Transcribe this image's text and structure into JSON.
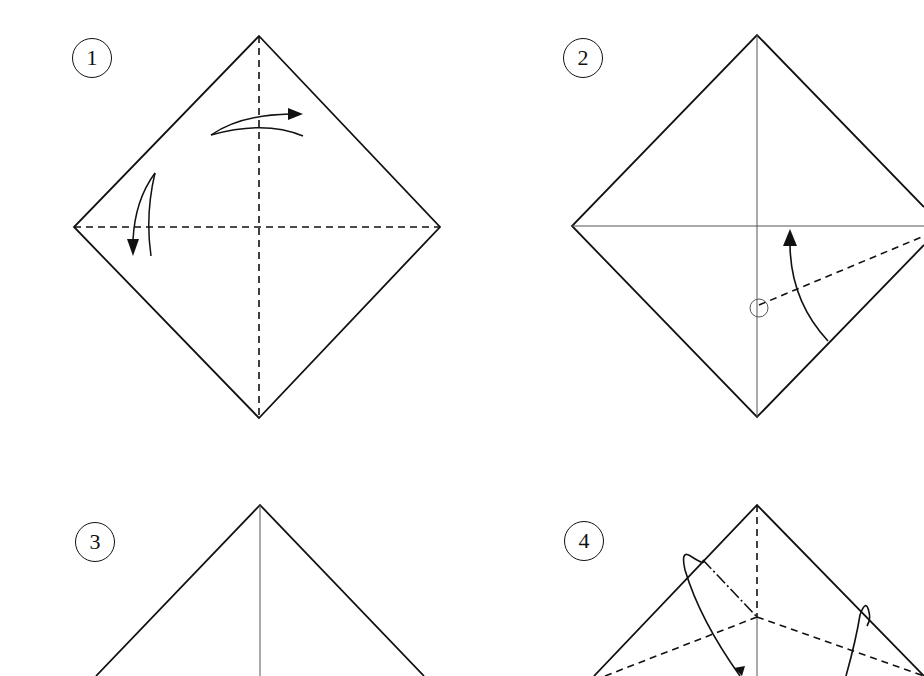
{
  "colors": {
    "line": "#111111",
    "crease": "#555555",
    "background": "#ffffff"
  },
  "steps": [
    {
      "number": "1",
      "description": "Square paper as diamond; valley-fold diagonals (dashed) both ways and unfold",
      "icons": [
        "curved-arrow-right",
        "curved-arrow-down"
      ]
    },
    {
      "number": "2",
      "description": "Fold lower-right edge up to the center crease along dashed line toward a marked point",
      "icons": [
        "curved-arrow-up",
        "reference-point-circle"
      ]
    },
    {
      "number": "3",
      "description": "Top portion of diamond with vertical center crease"
    },
    {
      "number": "4",
      "description": "Diamond with dashed fold lines and looping arrows to reverse-fold sides",
      "icons": [
        "loop-arrow-left",
        "loop-arrow-right"
      ]
    }
  ]
}
